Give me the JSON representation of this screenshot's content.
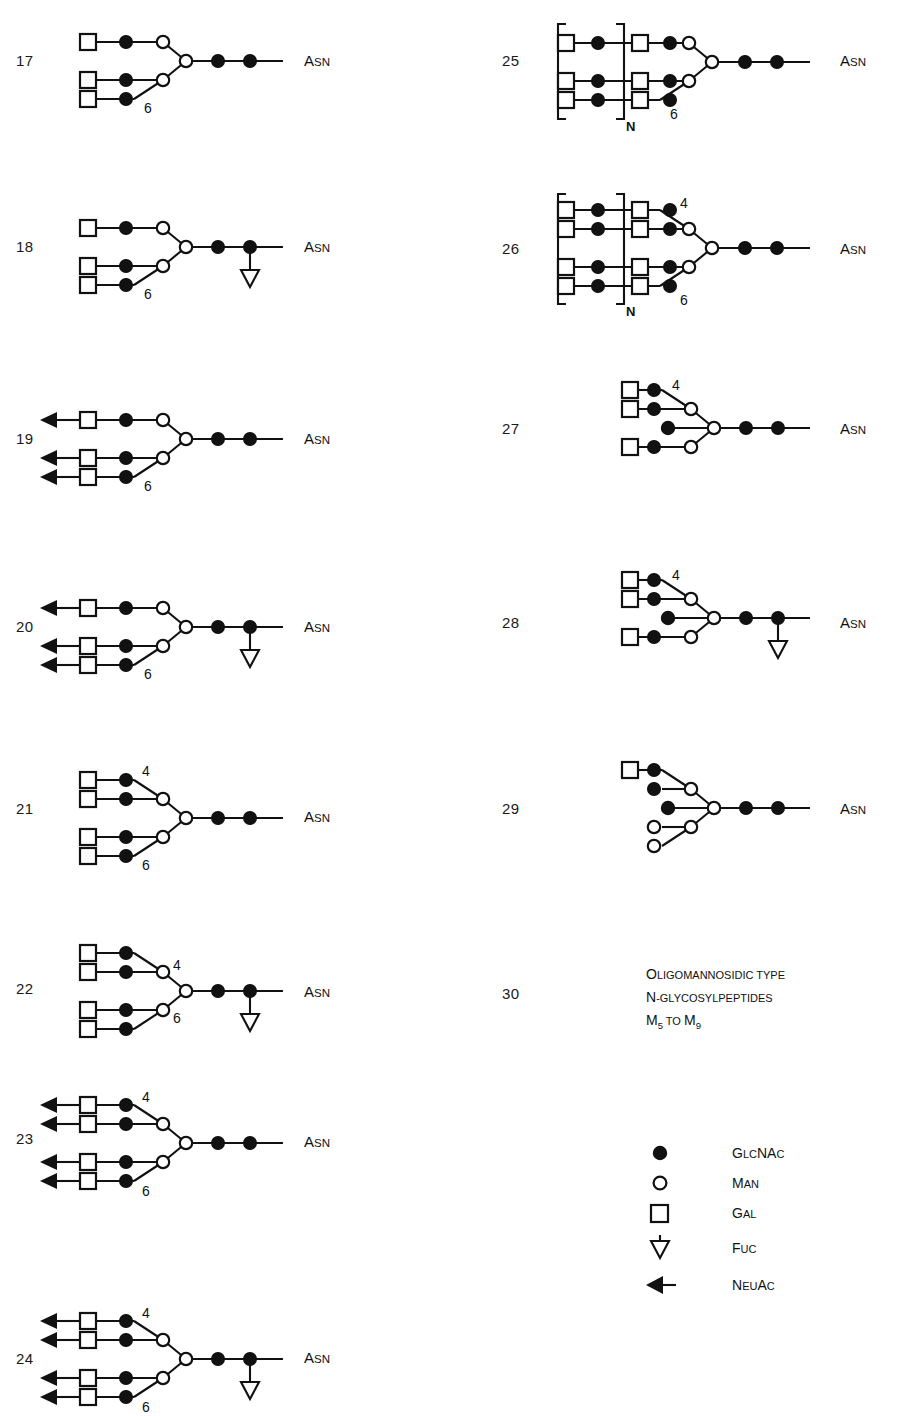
{
  "figure": {
    "type": "glycan-structure-diagram",
    "width": 899,
    "height": 1405,
    "asn_label": "Asn",
    "asn_label_main": "A",
    "asn_label_small": "SN"
  },
  "legend": {
    "title": "",
    "items": [
      {
        "symbol": "filled-circle",
        "label": "GlcNAc",
        "label_main": "G",
        "label_rest": "LC",
        "label_main2": "NA",
        "label_rest2": "C"
      },
      {
        "symbol": "open-circle",
        "label": "Man"
      },
      {
        "symbol": "open-square",
        "label": "Gal"
      },
      {
        "symbol": "down-triangle",
        "label": "Fuc"
      },
      {
        "symbol": "left-arrow",
        "label": "NeuAc"
      }
    ]
  },
  "text_block": {
    "number": "30",
    "lines": [
      "Oligomannosidic type",
      "N-glycosylpeptides",
      "M5 to M9"
    ],
    "line3_parts": [
      {
        "t": "M",
        "sub": "5"
      },
      {
        "t": " to "
      },
      {
        "t": "M",
        "sub": "9"
      }
    ]
  },
  "structures": [
    {
      "id": "17",
      "number": "17",
      "column": "left",
      "antennae": 3,
      "neuac": false,
      "fucose": false,
      "bisecting": false,
      "bracket": false,
      "labels": [
        "6"
      ]
    },
    {
      "id": "18",
      "number": "18",
      "column": "left",
      "antennae": 3,
      "neuac": false,
      "fucose": true,
      "bisecting": false,
      "bracket": false,
      "labels": [
        "6"
      ]
    },
    {
      "id": "19",
      "number": "19",
      "column": "left",
      "antennae": 3,
      "neuac": true,
      "fucose": false,
      "bisecting": false,
      "bracket": false,
      "labels": [
        "6"
      ]
    },
    {
      "id": "20",
      "number": "20",
      "column": "left",
      "antennae": 3,
      "neuac": true,
      "fucose": true,
      "bisecting": false,
      "bracket": false,
      "labels": [
        "6"
      ]
    },
    {
      "id": "21",
      "number": "21",
      "column": "left",
      "antennae": 4,
      "neuac": false,
      "fucose": false,
      "bisecting": false,
      "bracket": false,
      "labels": [
        "4",
        "6"
      ]
    },
    {
      "id": "22",
      "number": "22",
      "column": "left",
      "antennae": 4,
      "neuac": false,
      "fucose": true,
      "bisecting": false,
      "bracket": false,
      "labels": [
        "4",
        "6"
      ]
    },
    {
      "id": "23",
      "number": "23",
      "column": "left",
      "antennae": 4,
      "neuac": true,
      "fucose": false,
      "bisecting": false,
      "bracket": false,
      "labels": [
        "4",
        "6"
      ]
    },
    {
      "id": "24",
      "number": "24",
      "column": "left",
      "antennae": 4,
      "neuac": true,
      "fucose": true,
      "bisecting": false,
      "bracket": false,
      "labels": [
        "4",
        "6"
      ]
    },
    {
      "id": "25",
      "number": "25",
      "column": "right",
      "antennae": 3,
      "neuac": false,
      "fucose": false,
      "bisecting": false,
      "bracket": true,
      "bracket_label": "N",
      "labels": [
        "6"
      ]
    },
    {
      "id": "26",
      "number": "26",
      "column": "right",
      "antennae": 4,
      "neuac": false,
      "fucose": false,
      "bisecting": false,
      "bracket": true,
      "bracket_label": "N",
      "labels": [
        "4",
        "6"
      ]
    },
    {
      "id": "27",
      "number": "27",
      "column": "right",
      "antennae": 3,
      "neuac": false,
      "fucose": false,
      "bisecting": true,
      "bracket": false,
      "labels": [
        "4"
      ]
    },
    {
      "id": "28",
      "number": "28",
      "column": "right",
      "antennae": 3,
      "neuac": false,
      "fucose": true,
      "bisecting": true,
      "bracket": false,
      "labels": [
        "4"
      ]
    },
    {
      "id": "29",
      "number": "29",
      "column": "right",
      "antennae": 0,
      "neuac": false,
      "fucose": false,
      "bisecting": true,
      "bracket": false,
      "hybrid": true,
      "labels": []
    }
  ]
}
